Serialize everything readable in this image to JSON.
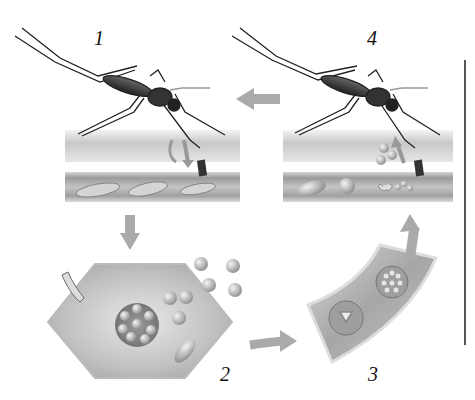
{
  "diagram": {
    "stages": [
      {
        "number": "1",
        "description": "Mosquito bite injects sporozoites into skin and blood vessel"
      },
      {
        "number": "2",
        "description": "Liver cell infected; schizont releases merozoites"
      },
      {
        "number": "3",
        "description": "Red blood cells in blood vessel infected (ring stage, schizont)"
      },
      {
        "number": "4",
        "description": "Mosquito takes up gametocytes from blood"
      }
    ],
    "arrows": [
      {
        "from": "1",
        "to": "2",
        "direction": "down"
      },
      {
        "from": "2",
        "to": "3",
        "direction": "right"
      },
      {
        "from": "3",
        "to": "4",
        "direction": "up"
      },
      {
        "from": "4",
        "to": "1",
        "direction": "left"
      }
    ],
    "colors": {
      "background": "#ffffff",
      "tissue": "#b8b8b8",
      "arrow": "#a0a0a0",
      "ink": "#111111"
    }
  }
}
